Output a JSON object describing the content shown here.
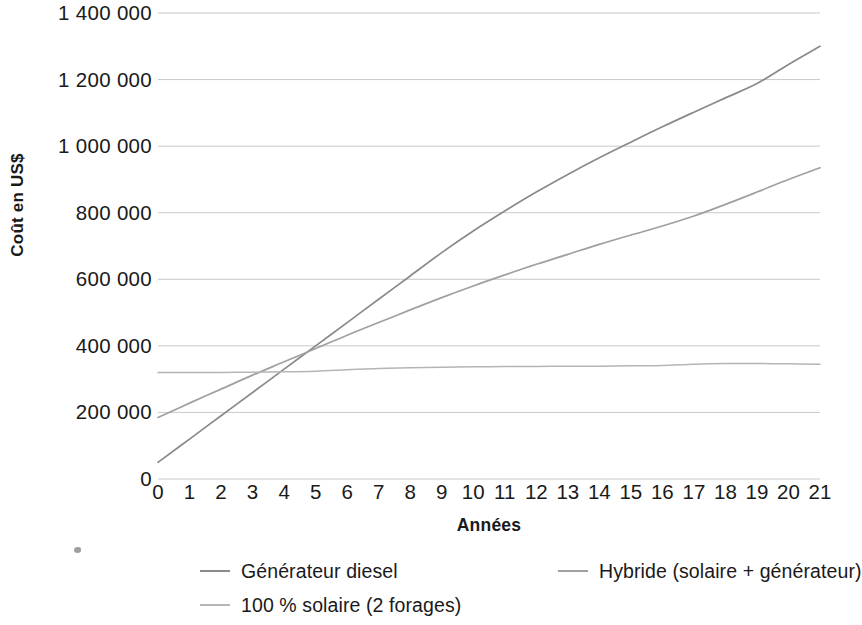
{
  "chart": {
    "type": "line",
    "xlabel": "Années",
    "ylabel": "Coût en US$",
    "y_ticks": [
      "1 400 000",
      "1 200 000",
      "1 000 000",
      "800 000",
      "600 000",
      "400 000",
      "200 000",
      "0"
    ],
    "x_ticks": [
      "0",
      "1",
      "2",
      "3",
      "4",
      "5",
      "6",
      "7",
      "8",
      "9",
      "10",
      "11",
      "12",
      "13",
      "14",
      "15",
      "16",
      "17",
      "18",
      "19",
      "20",
      "21"
    ],
    "legend": [
      {
        "label": "Générateur diesel",
        "color": "#8a8a8a"
      },
      {
        "label": "Hybride (solaire + générateur)",
        "color": "#a0a0a0"
      },
      {
        "label": "100 % solaire (2 forages)",
        "color": "#b5b5b5"
      }
    ]
  },
  "chart_data": {
    "type": "line",
    "title": "",
    "xlabel": "Années",
    "ylabel": "Coût en US$",
    "xlim": [
      0,
      21
    ],
    "ylim": [
      0,
      1400000
    ],
    "grid": true,
    "legend_position": "bottom",
    "x": [
      0,
      1,
      2,
      3,
      4,
      5,
      6,
      7,
      8,
      9,
      10,
      11,
      12,
      13,
      14,
      15,
      16,
      17,
      18,
      19,
      20,
      21
    ],
    "series": [
      {
        "name": "Générateur diesel",
        "color": "#8a8a8a",
        "values": [
          50000,
          120000,
          190000,
          260000,
          330000,
          400000,
          470000,
          540000,
          610000,
          680000,
          745000,
          805000,
          862000,
          915000,
          965000,
          1012000,
          1058000,
          1102000,
          1145000,
          1188000,
          1245000,
          1300000
        ]
      },
      {
        "name": "Hybride (solaire + générateur)",
        "color": "#a0a0a0",
        "values": [
          185000,
          228000,
          270000,
          312000,
          352000,
          392000,
          432000,
          470000,
          508000,
          545000,
          580000,
          613000,
          645000,
          675000,
          705000,
          733000,
          760000,
          790000,
          825000,
          862000,
          900000,
          935000
        ]
      },
      {
        "name": "100 % solaire (2 forages)",
        "color": "#b5b5b5",
        "values": [
          320000,
          320000,
          320000,
          321000,
          322000,
          324000,
          328000,
          332000,
          334000,
          336000,
          337000,
          338000,
          338000,
          339000,
          339000,
          340000,
          341000,
          345000,
          347000,
          347000,
          346000,
          345000
        ]
      }
    ]
  }
}
